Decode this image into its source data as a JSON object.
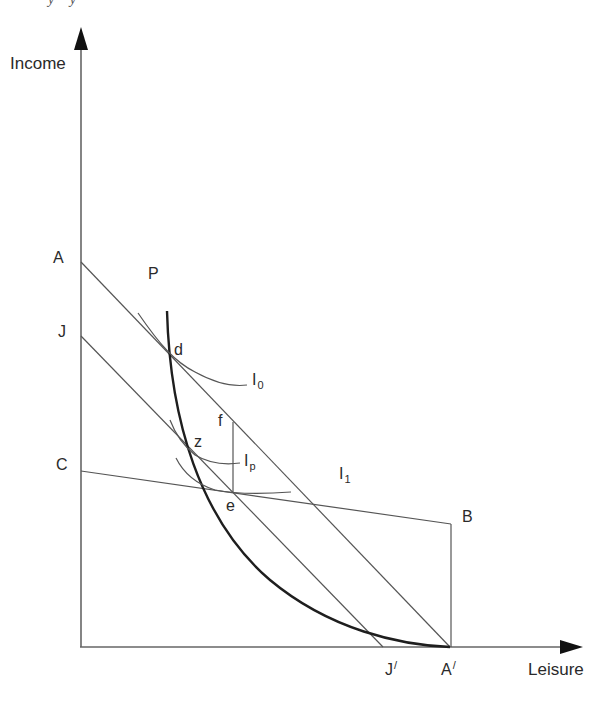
{
  "top_fragment": "y   y",
  "axes": {
    "y_label": "Income",
    "x_label": "Leisure"
  },
  "points": {
    "A": {
      "label": "A"
    },
    "J": {
      "label": "J"
    },
    "C": {
      "label": "C"
    },
    "B": {
      "label": "B"
    },
    "P": {
      "label": "P"
    },
    "d": {
      "label": "d"
    },
    "f": {
      "label": "f"
    },
    "z": {
      "label": "z"
    },
    "e": {
      "label": "e"
    },
    "J_prime": {
      "label": "J",
      "prime": "/"
    },
    "A_prime": {
      "label": "A",
      "prime": "/"
    }
  },
  "curves": {
    "I0": {
      "base": "I",
      "sub": "0"
    },
    "Ip": {
      "base": "I",
      "sub": "p"
    },
    "I1": {
      "base": "I",
      "sub": "1"
    }
  },
  "colors": {
    "line": "#555555",
    "thick_curve": "#1e1e1e",
    "text": "#2a2a2a"
  }
}
